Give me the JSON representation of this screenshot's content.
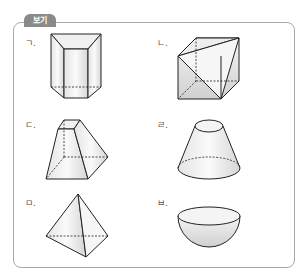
{
  "header": {
    "tag_label": "보기"
  },
  "items": [
    {
      "label": "ㄱ.",
      "shape": "triangular-prism-icon"
    },
    {
      "label": "ㄴ.",
      "shape": "cube-with-diagonals-icon"
    },
    {
      "label": "ㄷ.",
      "shape": "square-frustum-icon"
    },
    {
      "label": "ㄹ.",
      "shape": "cone-frustum-icon"
    },
    {
      "label": "ㅁ.",
      "shape": "triangular-pyramid-icon"
    },
    {
      "label": "ㅂ.",
      "shape": "hemisphere-icon"
    }
  ],
  "colors": {
    "tag_bg": "#8a8a8a",
    "border": "#a8a8a8",
    "stroke": "#222222",
    "fill_light": "#f2f2f2",
    "fill_dark": "#d8d8d8"
  }
}
